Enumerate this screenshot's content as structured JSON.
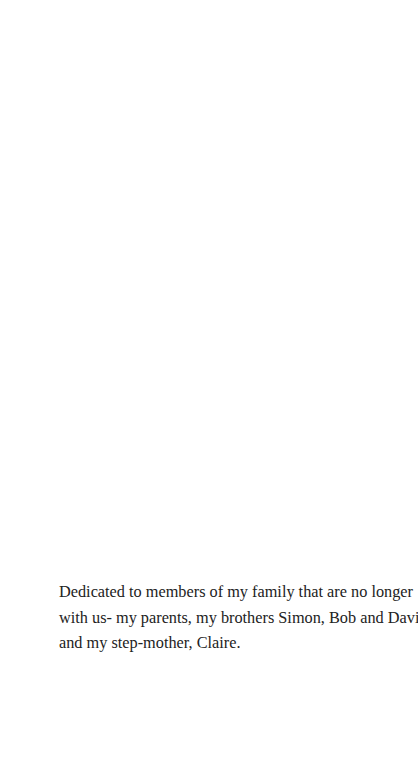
{
  "page": {
    "type": "dedication-page",
    "background_color": "#ffffff",
    "text_color": "#222222"
  },
  "dedication": {
    "full_text": "Dedicated to members of my family that are no longer with us- my parents, my brothers Simon, Bob and David and my step-mother, Claire.",
    "lines": [
      "Dedicated to members of my family that are no longer",
      "with us- my parents, my brothers Simon, Bob and David",
      "and my step-mother, Claire."
    ]
  }
}
